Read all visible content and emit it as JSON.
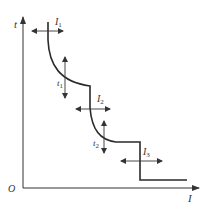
{
  "diagram": {
    "type": "time-current protection characteristic",
    "axes": {
      "y_label": "t",
      "x_label": "I",
      "origin_label": "O"
    },
    "adjustments": [
      {
        "id": "I1",
        "symbol": "I",
        "subscript": "1",
        "direction": "horizontal",
        "meaning": "current setting 1"
      },
      {
        "id": "t1",
        "symbol": "t",
        "subscript": "1",
        "direction": "vertical",
        "meaning": "time setting 1"
      },
      {
        "id": "I2",
        "symbol": "I",
        "subscript": "2",
        "direction": "horizontal",
        "meaning": "current setting 2"
      },
      {
        "id": "t2",
        "symbol": "t",
        "subscript": "2",
        "direction": "vertical",
        "meaning": "time setting 2"
      },
      {
        "id": "I3",
        "symbol": "I",
        "subscript": "3",
        "direction": "horizontal",
        "meaning": "current setting 3"
      }
    ],
    "colors": {
      "line": "#2a2a2a",
      "axis": "#333333",
      "background": "#ffffff"
    }
  }
}
